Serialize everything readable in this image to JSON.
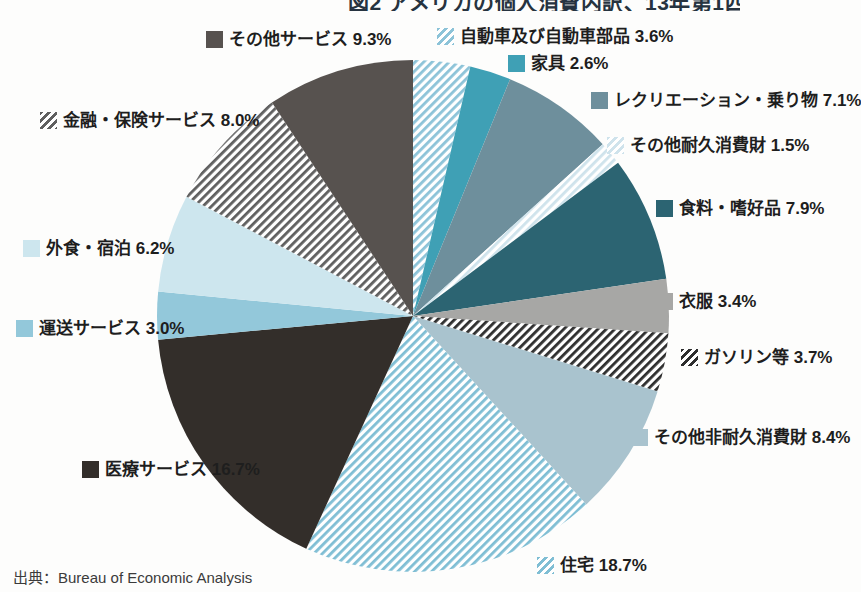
{
  "title_cropped_text": "図2 アメリカの個人消費内訳、13年第1四半期",
  "source": "出典：Bureau of Economic Analysis",
  "chart_data": {
    "type": "pie",
    "direction": "clockwise",
    "start_angle_deg": 0,
    "legend_position": "around",
    "slices": [
      {
        "label": "自動車及び自動車部品",
        "value": 3.6,
        "text": "自動車及び自動車部品 3.6%",
        "style": "stripe",
        "color": "#8cc3d8"
      },
      {
        "label": "家具",
        "value": 2.6,
        "text": "家具 2.6%",
        "style": "solid",
        "color": "#3fa0b5"
      },
      {
        "label": "レクリエーション・乗り物",
        "value": 7.1,
        "text": "レクリエーション・乗り物 7.1%",
        "style": "solid",
        "color": "#6e8f9c"
      },
      {
        "label": "その他耐久消費財",
        "value": 1.5,
        "text": "その他耐久消費財 1.5%",
        "style": "stripe",
        "color": "#cfe3ec"
      },
      {
        "label": "食料・嗜好品",
        "value": 7.9,
        "text": "食料・嗜好品 7.9%",
        "style": "solid",
        "color": "#2c6472"
      },
      {
        "label": "衣服",
        "value": 3.4,
        "text": "衣服 3.4%",
        "style": "solid",
        "color": "#a7a7a5"
      },
      {
        "label": "ガソリン等",
        "value": 3.7,
        "text": "ガソリン等 3.7%",
        "style": "stripe",
        "color": "#2e2e2e"
      },
      {
        "label": "その他非耐久消費財",
        "value": 8.4,
        "text": "その他非耐久消費財 8.4%",
        "style": "solid",
        "color": "#a9c3ce"
      },
      {
        "label": "住宅",
        "value": 18.7,
        "text": "住宅 18.7%",
        "style": "stripe",
        "color": "#7fbed4"
      },
      {
        "label": "医療サービス",
        "value": 16.7,
        "text": "医療サービス 16.7%",
        "style": "solid",
        "color": "#332e2a"
      },
      {
        "label": "運送サービス",
        "value": 3.0,
        "text": "運送サービス 3.0%",
        "style": "solid",
        "color": "#93c8da"
      },
      {
        "label": "外食・宿泊",
        "value": 6.2,
        "text": "外食・宿泊 6.2%",
        "style": "solid",
        "color": "#cde6ee"
      },
      {
        "label": "金融・保険サービス",
        "value": 8.0,
        "text": "金融・保険サービス 8.0%",
        "style": "stripe",
        "color": "#5f5f5f"
      },
      {
        "label": "その他サービス",
        "value": 9.3,
        "text": "その他サービス 9.3%",
        "style": "solid",
        "color": "#57524f"
      }
    ]
  }
}
